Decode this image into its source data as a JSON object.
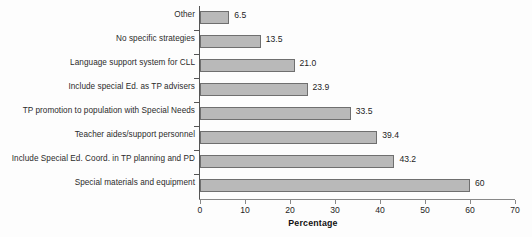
{
  "chart_data": {
    "type": "bar",
    "orientation": "horizontal",
    "title": "",
    "xlabel": "Percentage",
    "ylabel": "",
    "xlim": [
      0,
      70
    ],
    "xticks": [
      0,
      10,
      20,
      30,
      40,
      50,
      60,
      70
    ],
    "grid": false,
    "legend": null,
    "bar_color": "#b9b9b9",
    "bar_border_color": "#6f6f6f",
    "axis_color": "#555555",
    "categories": [
      "Other",
      "No specific strategies",
      "Language support system for CLL",
      "Include special Ed. as TP advisers",
      "TP promotion to population with Special Needs",
      "Teacher aides/support personnel",
      "Include Special Ed. Coord. in TP planning and PD",
      "Special materials and equipment"
    ],
    "values": [
      6.5,
      13.5,
      21.0,
      23.9,
      33.5,
      39.4,
      43.2,
      60
    ],
    "value_labels": [
      "6.5",
      "13.5",
      "21.0",
      "23.9",
      "33.5",
      "39.4",
      "43.2",
      "60"
    ]
  }
}
